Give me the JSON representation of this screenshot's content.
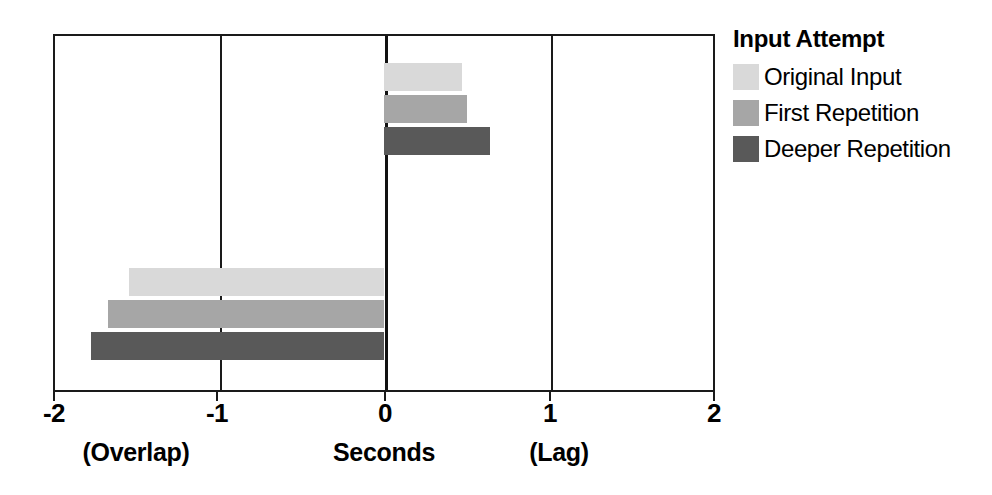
{
  "chart_data": {
    "type": "bar",
    "orientation": "horizontal",
    "title": "",
    "xlabel": "Seconds",
    "ylabel": "",
    "xlim": [
      -2,
      2
    ],
    "xticks": [
      -2,
      -1,
      0,
      1,
      2
    ],
    "xtick_labels": [
      "-2",
      "-1",
      "0",
      "1",
      "2"
    ],
    "grid": true,
    "gridlines_at": [
      -1,
      0,
      1
    ],
    "zero_line": 0,
    "legend_position": "right",
    "legend_title": "Input Attempt",
    "axis_left_caption": "(Overlap)",
    "axis_center_caption": "Seconds",
    "axis_right_caption": "(Lag)",
    "groups": [
      "Positive Lag Group",
      "Negative Overlap Group"
    ],
    "series": [
      {
        "name": "Original Input",
        "color": "#d9d9d9",
        "values": [
          0.47,
          -1.54
        ]
      },
      {
        "name": "First Repetition",
        "color": "#a6a6a6",
        "values": [
          0.5,
          -1.67
        ]
      },
      {
        "name": "Deeper Repetition",
        "color": "#595959",
        "values": [
          0.64,
          -1.77
        ]
      }
    ]
  },
  "legend": {
    "title": "Input Attempt",
    "items": [
      {
        "label": "Original Input",
        "color": "#d9d9d9"
      },
      {
        "label": "First Repetition",
        "color": "#a6a6a6"
      },
      {
        "label": "Deeper Repetition",
        "color": "#595959"
      }
    ]
  },
  "axis": {
    "tick_labels": [
      "-2",
      "-1",
      "0",
      "1",
      "2"
    ],
    "captions": {
      "left": "(Overlap)",
      "center": "Seconds",
      "right": "(Lag)"
    }
  }
}
